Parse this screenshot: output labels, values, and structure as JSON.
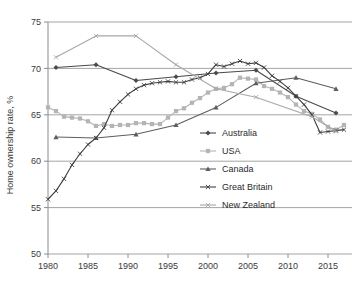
{
  "chart_data": {
    "type": "line",
    "title": "",
    "xlabel": "",
    "ylabel": "Home ownership rate, %",
    "xlim": [
      1980,
      2018
    ],
    "ylim": [
      50,
      75
    ],
    "xticks": [
      1980,
      1985,
      1990,
      1995,
      2000,
      2005,
      2010,
      2015
    ],
    "yticks": [
      50,
      55,
      60,
      65,
      70,
      75
    ],
    "grid": "horizontal",
    "legend_position": "center-right-inside",
    "series": [
      {
        "name": "Australia",
        "color": "#4a4a4a",
        "marker": "diamond",
        "x": [
          1981,
          1986,
          1991,
          1996,
          2001,
          2006,
          2011,
          2016
        ],
        "values": [
          70.1,
          70.4,
          68.7,
          69.1,
          69.5,
          69.8,
          67.0,
          65.2
        ]
      },
      {
        "name": "USA",
        "color": "#b4b4b4",
        "marker": "square",
        "x": [
          1980,
          1981,
          1982,
          1983,
          1984,
          1985,
          1986,
          1987,
          1988,
          1989,
          1990,
          1991,
          1992,
          1993,
          1994,
          1995,
          1996,
          1997,
          1998,
          1999,
          2000,
          2001,
          2002,
          2003,
          2004,
          2005,
          2006,
          2007,
          2008,
          2009,
          2010,
          2011,
          2012,
          2013,
          2014,
          2015,
          2016,
          2017
        ],
        "values": [
          65.8,
          65.4,
          64.8,
          64.7,
          64.6,
          64.3,
          63.8,
          64.0,
          63.8,
          63.9,
          63.9,
          64.1,
          64.1,
          64.0,
          64.0,
          64.7,
          65.4,
          65.7,
          66.3,
          66.8,
          67.4,
          67.8,
          67.9,
          68.3,
          69.0,
          68.9,
          68.8,
          68.1,
          67.8,
          67.4,
          66.9,
          66.1,
          65.4,
          65.1,
          64.5,
          63.7,
          63.4,
          63.9
        ]
      },
      {
        "name": "Canada",
        "color": "#5e5e5e",
        "marker": "triangle",
        "x": [
          1981,
          1986,
          1991,
          1996,
          2001,
          2006,
          2011,
          2016
        ],
        "values": [
          62.6,
          62.5,
          62.9,
          63.9,
          65.8,
          68.4,
          69.0,
          67.8
        ]
      },
      {
        "name": "Great Britain",
        "color": "#3f3f3f",
        "marker": "cross",
        "x": [
          1980,
          1981,
          1982,
          1983,
          1984,
          1985,
          1986,
          1987,
          1988,
          1989,
          1990,
          1991,
          1992,
          1993,
          1994,
          1995,
          1996,
          1997,
          1998,
          1999,
          2000,
          2001,
          2002,
          2003,
          2004,
          2005,
          2006,
          2007,
          2008,
          2009,
          2010,
          2011,
          2012,
          2013,
          2014,
          2015,
          2016,
          2017
        ],
        "values": [
          55.9,
          56.8,
          58.1,
          59.6,
          60.8,
          61.8,
          62.5,
          63.6,
          65.5,
          66.4,
          67.2,
          67.8,
          68.2,
          68.4,
          68.5,
          68.6,
          68.5,
          68.5,
          68.8,
          69.0,
          69.4,
          70.4,
          70.2,
          70.5,
          70.8,
          70.5,
          70.6,
          70.1,
          69.2,
          68.6,
          67.9,
          67.0,
          66.1,
          65.0,
          63.1,
          63.2,
          63.3,
          63.4
        ]
      },
      {
        "name": "New Zealand",
        "color": "#a8a8a8",
        "marker": "cross",
        "x": [
          1981,
          1986,
          1991,
          1996,
          2001,
          2006,
          2013,
          2016
        ],
        "values": [
          71.2,
          73.5,
          73.5,
          70.4,
          67.8,
          66.9,
          64.8,
          63.2
        ]
      }
    ]
  },
  "legend": {
    "items": [
      {
        "label": "Australia"
      },
      {
        "label": "USA"
      },
      {
        "label": "Canada"
      },
      {
        "label": "Great Britain"
      },
      {
        "label": "New Zealand"
      }
    ]
  },
  "axes": {
    "y_title": "Home ownership rate, %",
    "x_tick_labels": [
      "1980",
      "1985",
      "1990",
      "1995",
      "2000",
      "2005",
      "2010",
      "2015"
    ],
    "y_tick_labels": [
      "50",
      "55",
      "60",
      "65",
      "70",
      "75"
    ]
  },
  "colors": {
    "grid": "#9a9a9a",
    "axis": "#8c8c8c",
    "text": "#333333",
    "background": "#ffffff"
  }
}
